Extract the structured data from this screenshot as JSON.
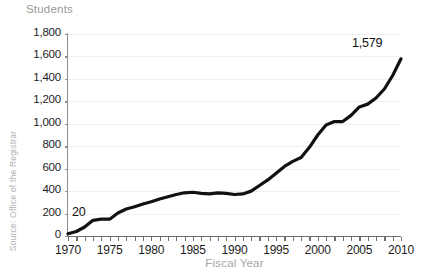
{
  "chart_data": {
    "type": "line",
    "title": "",
    "ylabel": "Students",
    "xlabel": "Fiscal Year",
    "source": "Source: Office of the Registrar",
    "grid": true,
    "legend": "none",
    "xlim": [
      1970,
      2010
    ],
    "ylim": [
      0,
      1800
    ],
    "y_ticks": [
      0,
      200,
      400,
      600,
      800,
      1000,
      1200,
      1400,
      1600,
      1800
    ],
    "y_tick_labels": [
      "0",
      "200",
      "400",
      "600",
      "800",
      "1,000",
      "1,200",
      "1,400",
      "1,600",
      "1,800"
    ],
    "x_ticks": [
      1970,
      1975,
      1980,
      1985,
      1990,
      1995,
      2000,
      2005,
      2010
    ],
    "x_tick_labels": [
      "1970",
      "1975",
      "1980",
      "1985",
      "1990",
      "1995",
      "2000",
      "2005",
      "2010"
    ],
    "x_minor_ticks_every": 1,
    "line_color": "#111111",
    "grid_color": "#f0f0f0",
    "axis_color": "#6f6f6f",
    "label_color": "#9a9a9a",
    "series": [
      {
        "name": "Students",
        "x": [
          1970,
          1971,
          1972,
          1973,
          1974,
          1975,
          1976,
          1977,
          1978,
          1979,
          1980,
          1981,
          1982,
          1983,
          1984,
          1985,
          1986,
          1987,
          1988,
          1989,
          1990,
          1991,
          1992,
          1993,
          1994,
          1995,
          1996,
          1997,
          1998,
          1999,
          2000,
          2001,
          2002,
          2003,
          2004,
          2005,
          2006,
          2007,
          2008,
          2009,
          2010
        ],
        "values": [
          20,
          40,
          80,
          140,
          150,
          150,
          205,
          240,
          260,
          285,
          305,
          330,
          350,
          370,
          385,
          390,
          380,
          375,
          385,
          380,
          370,
          375,
          400,
          450,
          500,
          560,
          620,
          665,
          700,
          790,
          900,
          990,
          1020,
          1020,
          1075,
          1150,
          1175,
          1230,
          1310,
          1430,
          1579
        ]
      }
    ],
    "annotations": [
      {
        "name": "start-value",
        "x": 1970,
        "value": 20,
        "label": "20"
      },
      {
        "name": "end-value",
        "x": 2010,
        "value": 1579,
        "label": "1,579"
      }
    ]
  },
  "chart": {
    "y_axis_title": "Students",
    "x_axis_title": "Fiscal Year",
    "source_note": "Source: Office of the Registrar",
    "start_label": "20",
    "end_label": "1,579"
  }
}
